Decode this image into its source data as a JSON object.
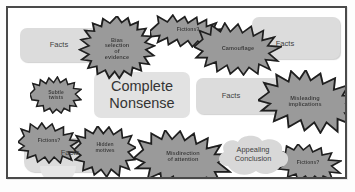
{
  "diagram": {
    "title": "Complete Nonsense",
    "center": {
      "label": "Complete\nNonsense"
    },
    "colors": {
      "burst_fill": "#9a9a9a",
      "burst_stroke": "#1f1f1f",
      "soft_fill": "#dcdcdc",
      "cloud_fill": "#d8d8d8",
      "frame_stroke": "#4a4a4a",
      "background": "#ffffff",
      "text": "#3a3a3a"
    },
    "bursts": [
      {
        "id": "bias-selection-of-evidence",
        "label": "Bias\nselection\nof\nevidence"
      },
      {
        "id": "fictions-top",
        "label": "Fictions?"
      },
      {
        "id": "camouflage",
        "label": "Camouflage"
      },
      {
        "id": "subtle-twists",
        "label": "Subtle\ntwists"
      },
      {
        "id": "misleading-implications",
        "label": "Misleading\nimplications"
      },
      {
        "id": "fictions-left",
        "label": "Fictions?"
      },
      {
        "id": "hidden-motives",
        "label": "Hidden\nmotives"
      },
      {
        "id": "misdirection-of-attention",
        "label": "Misdirection\nof attention"
      },
      {
        "id": "fictions-bottom-right",
        "label": "Fictions?"
      }
    ],
    "facts_boxes": [
      {
        "id": "facts-top-left",
        "label": "Facts"
      },
      {
        "id": "facts-top-right",
        "label": "Facts"
      },
      {
        "id": "facts-middle-right",
        "label": "Facts"
      },
      {
        "id": "facts-bottom-left",
        "label": "Facts"
      }
    ],
    "clouds": [
      {
        "id": "appealing-conclusion",
        "label": "Appealing\nConclusion"
      }
    ]
  }
}
